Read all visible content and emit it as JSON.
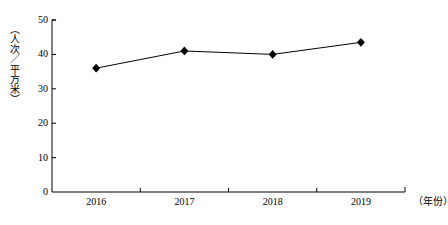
{
  "chart_data": {
    "type": "line",
    "title": "",
    "xlabel": "（年份）",
    "ylabel": "（人次／平方米）",
    "categories": [
      "2016",
      "2017",
      "2018",
      "2019"
    ],
    "values": [
      36,
      41,
      40,
      43.5
    ],
    "series": [
      {
        "name": "人次／平方米",
        "values": [
          36,
          41,
          40,
          43.5
        ]
      }
    ],
    "ylim": [
      0,
      50
    ],
    "ytick_labels": [
      "0",
      "10",
      "20",
      "30",
      "40",
      "50"
    ],
    "ytick_values": [
      0,
      10,
      20,
      30,
      40,
      50
    ],
    "grid": false,
    "legend": "none",
    "marker": "diamond",
    "line_color": "#000000",
    "marker_color": "#000000",
    "axis_color": "#000000",
    "background": "#ffffff"
  }
}
